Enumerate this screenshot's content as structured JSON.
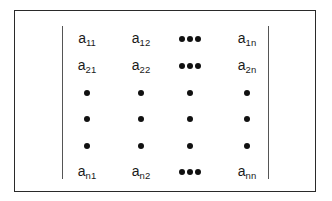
{
  "matrix": {
    "rows": [
      [
        {
          "type": "elem",
          "base": "a",
          "sub": "11"
        },
        {
          "type": "elem",
          "base": "a",
          "sub": "12"
        },
        {
          "type": "hdots"
        },
        {
          "type": "elem",
          "base": "a",
          "sub": "1n"
        }
      ],
      [
        {
          "type": "elem",
          "base": "a",
          "sub": "21"
        },
        {
          "type": "elem",
          "base": "a",
          "sub": "22"
        },
        {
          "type": "hdots"
        },
        {
          "type": "elem",
          "base": "a",
          "sub": "2n"
        }
      ],
      [
        {
          "type": "dot"
        },
        {
          "type": "dot"
        },
        {
          "type": "dot"
        },
        {
          "type": "dot"
        }
      ],
      [
        {
          "type": "dot"
        },
        {
          "type": "dot"
        },
        {
          "type": "dot"
        },
        {
          "type": "dot"
        }
      ],
      [
        {
          "type": "dot"
        },
        {
          "type": "dot"
        },
        {
          "type": "dot"
        },
        {
          "type": "dot"
        }
      ],
      [
        {
          "type": "elem",
          "base": "a",
          "sub": "n1"
        },
        {
          "type": "elem",
          "base": "a",
          "sub": "n2"
        },
        {
          "type": "hdots"
        },
        {
          "type": "elem",
          "base": "a",
          "sub": "nn"
        }
      ]
    ],
    "column_x": [
      87,
      141,
      190,
      247
    ],
    "row_y": [
      38,
      65,
      92,
      118,
      145,
      171
    ],
    "delimiter": "determinant-bars"
  }
}
